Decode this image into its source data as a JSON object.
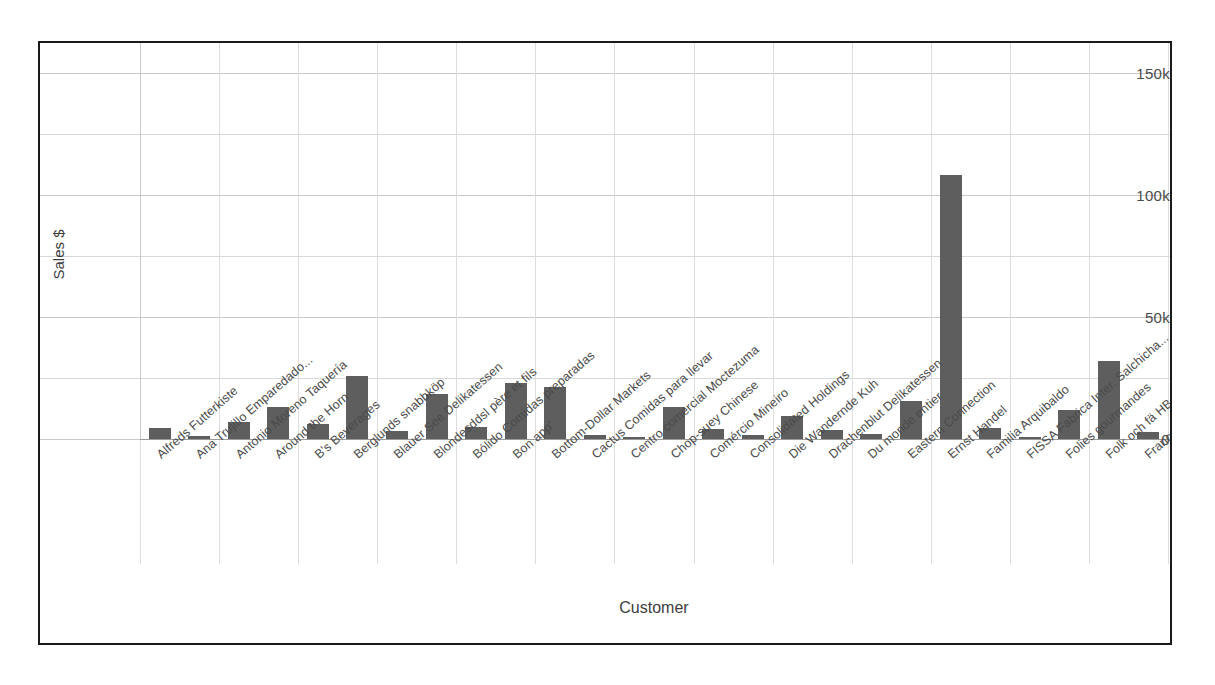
{
  "chart_data": {
    "type": "bar",
    "title": "",
    "xlabel": "Customer",
    "ylabel": "Sales $",
    "ylim": [
      0,
      160000
    ],
    "yticks": [
      0,
      50000,
      100000,
      150000
    ],
    "ytick_labels": [
      "0",
      "50k",
      "100k",
      "150k"
    ],
    "grid": true,
    "legend": "none",
    "bar_color": "#5e5e5e",
    "categories": [
      "Alfreds Futterkiste",
      "Ana Trujillo Emparedado...",
      "Antonio Moreno Taquería",
      "Around the Horn",
      "B's Beverages",
      "Berglunds snabbköp",
      "Blauer See Delikatessen",
      "Blondesddsl père et fils",
      "Bólido Comidas preparadas",
      "Bon app'",
      "Bottom-Dollar Markets",
      "Cactus Comidas para llevar",
      "Centro comercial Moctezuma",
      "Chop-suey Chinese",
      "Comércio Mineiro",
      "Consolidated Holdings",
      "Die Wandernde Kuh",
      "Drachenblut Delikatessen",
      "Du monde entier",
      "Eastern Connection",
      "Ernst Handel",
      "Familia Arquibaldo",
      "FISSA Fabrica Inter. Salchicha...",
      "Folies gourmandes",
      "Folk och fä HB",
      "France restauration"
    ],
    "values": [
      4600,
      1400,
      7000,
      13200,
      6000,
      26000,
      3200,
      18500,
      4800,
      23000,
      21400,
      1500,
      100,
      13000,
      3900,
      1600,
      9600,
      3500,
      1900,
      15500,
      108000,
      4400,
      100,
      12000,
      32000,
      3000
    ]
  },
  "axes": {
    "y_title": "Sales $",
    "x_title": "Customer"
  }
}
